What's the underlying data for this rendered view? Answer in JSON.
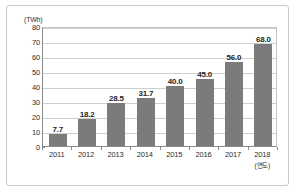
{
  "chart_data": {
    "type": "bar",
    "title": "",
    "xlabel": "(연도)",
    "ylabel": "(TWh)",
    "categories": [
      "2011",
      "2012",
      "2013",
      "2014",
      "2015",
      "2016",
      "2017",
      "2018"
    ],
    "values": [
      7.7,
      18.2,
      28.5,
      31.7,
      40.0,
      45.0,
      56.0,
      68.0
    ],
    "data_labels": [
      "7.7",
      "18.2",
      "28.5",
      "31.7",
      "40.0",
      "45.0",
      "56.0",
      "68.0"
    ],
    "ylim": [
      0,
      80
    ],
    "ytick_labels": [
      "80",
      "70",
      "60",
      "50",
      "40",
      "30",
      "20",
      "10",
      "0"
    ],
    "ytick_values": [
      80,
      70,
      60,
      50,
      40,
      30,
      20,
      10,
      0
    ],
    "grid": true,
    "legend": false,
    "bar_color": "#7b7b7b",
    "grid_color": "#cfcfcf",
    "axis_color": "#8a8a8a",
    "background": "#ffffff",
    "last_category_note": "(연도)"
  }
}
